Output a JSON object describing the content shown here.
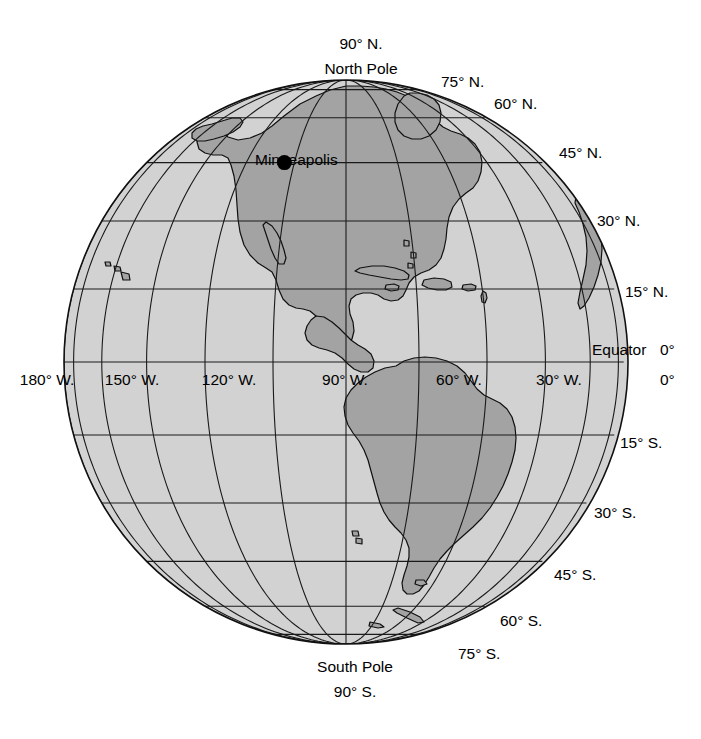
{
  "figure": {
    "type": "globe-map",
    "projection": "orthographic",
    "center_lon": -75,
    "center_lat": 0,
    "hemisphere": "Western Hemisphere"
  },
  "colors": {
    "land": "#a3a3a3",
    "ocean": "#d2d2d2",
    "line": "#1a1a1a",
    "background": "#ffffff",
    "marker": "#000000"
  },
  "poles": {
    "north": {
      "degrees": "90° N.",
      "name": "North Pole"
    },
    "south": {
      "name": "South Pole",
      "degrees": "90° S."
    }
  },
  "latitude_labels": [
    {
      "text": "75° N.",
      "lat": 75
    },
    {
      "text": "60° N.",
      "lat": 60
    },
    {
      "text": "45° N.",
      "lat": 45
    },
    {
      "text": "30° N.",
      "lat": 30
    },
    {
      "text": "15° N.",
      "lat": 15
    },
    {
      "text": "0°",
      "lat": 0
    },
    {
      "text": "15° S.",
      "lat": -15
    },
    {
      "text": "30° S.",
      "lat": -30
    },
    {
      "text": "45° S.",
      "lat": -45
    },
    {
      "text": "60° S.",
      "lat": -60
    },
    {
      "text": "75° S.",
      "lat": -75
    }
  ],
  "equator_label": "Equator",
  "equator_degrees": "0°",
  "longitude_labels": [
    {
      "text": "180° W.",
      "lon": -180
    },
    {
      "text": "150° W.",
      "lon": -150
    },
    {
      "text": "120° W.",
      "lon": -120
    },
    {
      "text": "90° W.",
      "lon": -90
    },
    {
      "text": "60° W.",
      "lon": -60
    },
    {
      "text": "30° W.",
      "lon": -30
    },
    {
      "text": "0°",
      "lon": 0
    }
  ],
  "city_marker": {
    "label": "Minneapolis",
    "lat": 45,
    "lon": -93
  },
  "graticule": {
    "latitude_interval_degrees": 15,
    "longitude_interval_degrees": 15,
    "latitude_range": [
      -75,
      75
    ],
    "longitude_range": [
      -180,
      0
    ]
  }
}
